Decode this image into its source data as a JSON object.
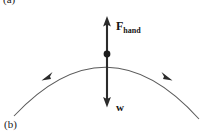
{
  "figure": {
    "width": 203,
    "height": 137,
    "background": "#ffffff",
    "stroke_color": "#555555",
    "vector_color": "#2b2b2b",
    "panel_labels": {
      "top": "(a)",
      "bottom": "(b)"
    },
    "labels": {
      "force_hand_main": "F",
      "force_hand_subscript": "hand",
      "weight": "w"
    },
    "pivot": {
      "x": 107,
      "y": 54,
      "radius": 3.4
    },
    "arrows": [
      {
        "name": "force-hand-arrow",
        "direction": "up",
        "x": 107,
        "tail_y": 54,
        "tip_y": 17,
        "label": "F_hand"
      },
      {
        "name": "weight-arrow",
        "direction": "down",
        "x": 107,
        "tail_y": 54,
        "tip_y": 107,
        "label": "w"
      }
    ],
    "arc": {
      "name": "trajectory-arc",
      "start": {
        "x": 14,
        "y": 116
      },
      "apex": {
        "x": 107,
        "y": 54
      },
      "end": {
        "x": 199,
        "y": 119
      },
      "motion_arrowheads": [
        {
          "side": "left",
          "x": 46,
          "y": 76,
          "points": "down-left"
        },
        {
          "side": "right",
          "x": 168,
          "y": 76,
          "points": "down-right"
        }
      ]
    }
  }
}
